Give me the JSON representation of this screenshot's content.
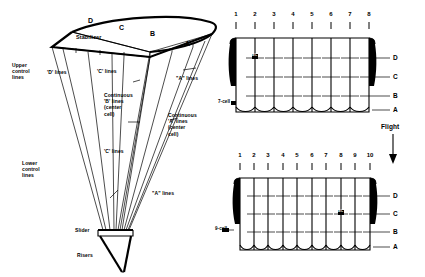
{
  "figure": {
    "left_view": {
      "name": "three-quarter canopy view",
      "canopy_labels": [
        {
          "id": "D",
          "text": "D"
        },
        {
          "id": "C",
          "text": "C"
        },
        {
          "id": "B",
          "text": "B"
        },
        {
          "id": "A",
          "text": "A"
        }
      ],
      "stabilizer_label": "Stabilizer",
      "annotations": [
        {
          "id": "upper-control-lines",
          "text": "Upper\ncontrol\nlines"
        },
        {
          "id": "d-lines",
          "text": "'D' lines"
        },
        {
          "id": "c-lines-upper",
          "text": "'C' lines"
        },
        {
          "id": "a-lines-upper",
          "text": "\"A\" lines"
        },
        {
          "id": "continuous-b-lines",
          "text": "Continuous\n'B' lines\n(center\ncell)"
        },
        {
          "id": "continuous-a-lines",
          "text": "Continuous\n'A' lines\n(center\ncell)"
        },
        {
          "id": "c-lines-lower",
          "text": "'C' lines"
        },
        {
          "id": "lower-control-lines",
          "text": "Lower\ncontrol\nlines"
        },
        {
          "id": "a-lines-lower",
          "text": "\"A\" lines"
        },
        {
          "id": "slider",
          "text": "Slider"
        },
        {
          "id": "risers",
          "text": "Risers"
        }
      ]
    },
    "top_right_view": {
      "name": "7-cell canopy plan view",
      "cell_count_label": "7-cell",
      "rib_numbers": [
        "1",
        "2",
        "3",
        "4",
        "5",
        "6",
        "7",
        "8"
      ],
      "row_labels": [
        "D",
        "C",
        "B",
        "A"
      ],
      "marker_label": "BC",
      "marker_rib": "2"
    },
    "bottom_right_view": {
      "name": "9-cell canopy plan view",
      "cell_count_label": "9-cell",
      "rib_numbers": [
        "1",
        "2",
        "3",
        "4",
        "5",
        "6",
        "7",
        "8",
        "9",
        "10"
      ],
      "row_labels": [
        "D",
        "C",
        "B",
        "A"
      ],
      "marker_label": "BC",
      "marker_rib": "8"
    },
    "flight_direction": {
      "label": "Flight",
      "arrow": "down-arrow-icon"
    },
    "colors": {
      "ink": "#000000",
      "background": "#ffffff"
    }
  }
}
